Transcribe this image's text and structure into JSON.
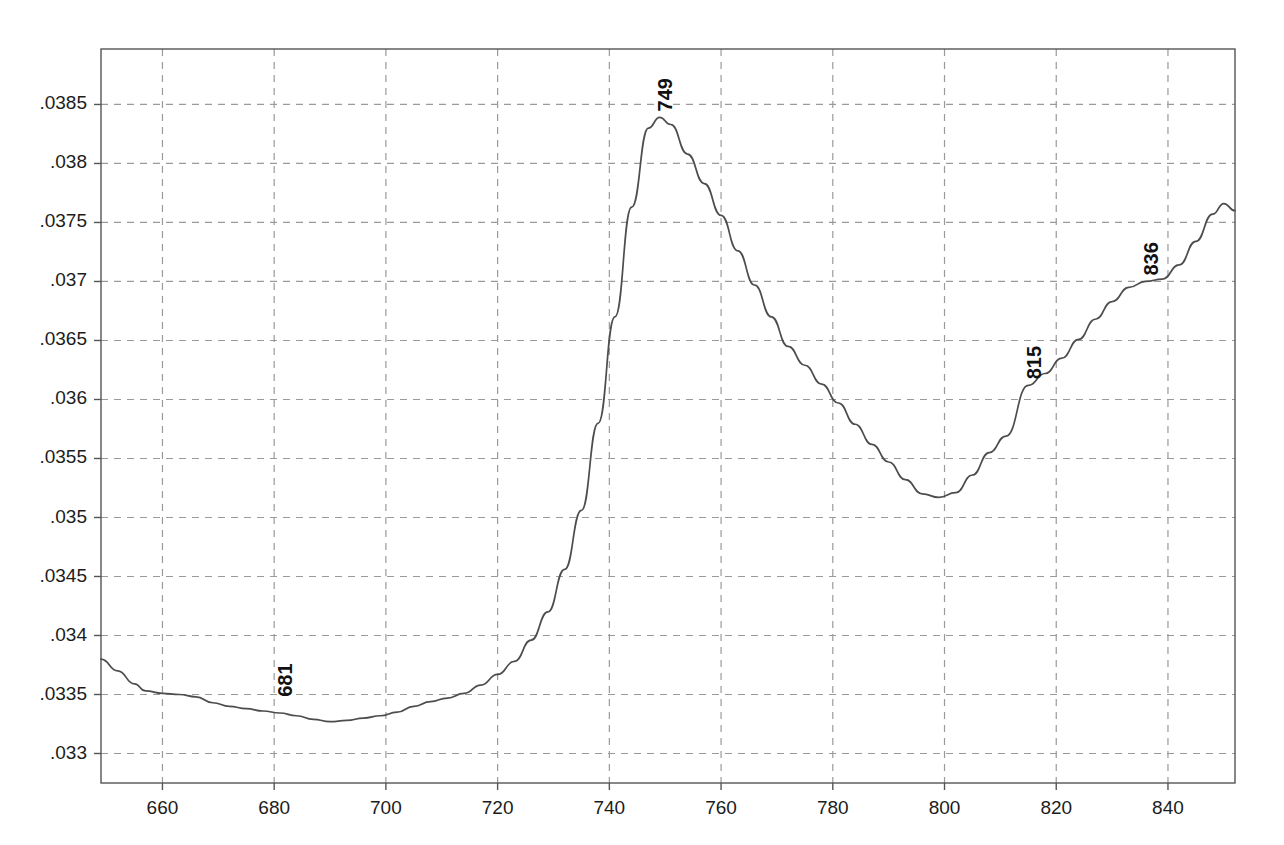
{
  "chart_data": {
    "type": "line",
    "title": "",
    "subtitle": "",
    "xlabel": "",
    "ylabel": "",
    "xlim": [
      649,
      852
    ],
    "ylim": [
      0.03275,
      0.03897
    ],
    "grid": true,
    "legend": null,
    "line_color": "#4d4d4d",
    "grid_color": "#9a9a9a",
    "axis_color": "#555555",
    "background": "#ffffff",
    "xticks": [
      660,
      680,
      700,
      720,
      740,
      760,
      780,
      800,
      820,
      840
    ],
    "xtick_labels": [
      "660",
      "680",
      "700",
      "720",
      "740",
      "760",
      "780",
      "800",
      "820",
      "840"
    ],
    "yticks": [
      0.033,
      0.0335,
      0.034,
      0.0345,
      0.035,
      0.0355,
      0.036,
      0.0365,
      0.037,
      0.0375,
      0.038,
      0.0385
    ],
    "ytick_labels": [
      ".033",
      ".0335",
      ".034",
      ".0345",
      ".035",
      ".0355",
      ".036",
      ".0365",
      ".037",
      ".0375",
      ".038",
      ".0385"
    ],
    "annotations": [
      {
        "label": "681",
        "x": 681,
        "y": 0.03343,
        "rotation": -90
      },
      {
        "label": "749",
        "x": 749,
        "y": 0.03839,
        "rotation": -90
      },
      {
        "label": "815",
        "x": 815,
        "y": 0.03612,
        "rotation": -90
      },
      {
        "label": "836",
        "x": 836,
        "y": 0.037,
        "rotation": -90
      }
    ],
    "series": [
      {
        "name": "spectrum",
        "x": [
          649,
          652,
          655,
          657,
          660,
          663,
          666,
          669,
          672,
          675,
          678,
          681,
          684,
          687,
          690,
          693,
          696,
          699,
          702,
          705,
          708,
          711,
          714,
          717,
          720,
          723,
          726,
          729,
          732,
          735,
          738,
          741,
          744,
          747,
          749,
          751,
          754,
          757,
          760,
          763,
          766,
          769,
          772,
          775,
          778,
          781,
          784,
          787,
          790,
          793,
          796,
          799,
          802,
          805,
          808,
          811,
          815,
          818,
          821,
          824,
          827,
          830,
          833,
          836,
          839,
          842,
          845,
          848,
          850,
          852
        ],
        "y": [
          0.0338,
          0.0337,
          0.03359,
          0.03353,
          0.03351,
          0.0335,
          0.03348,
          0.03343,
          0.0334,
          0.03338,
          0.03336,
          0.033343,
          0.03332,
          0.03329,
          0.03327,
          0.03328,
          0.0333,
          0.03332,
          0.03335,
          0.0334,
          0.03344,
          0.03347,
          0.03351,
          0.03358,
          0.03367,
          0.03378,
          0.03396,
          0.0342,
          0.03456,
          0.03506,
          0.0358,
          0.0367,
          0.03763,
          0.0383,
          0.03839,
          0.03833,
          0.03808,
          0.03783,
          0.03756,
          0.03726,
          0.03697,
          0.0367,
          0.03645,
          0.03629,
          0.03613,
          0.03597,
          0.03579,
          0.03562,
          0.03547,
          0.03532,
          0.0352,
          0.03517,
          0.03521,
          0.03536,
          0.03555,
          0.03569,
          0.03612,
          0.03622,
          0.03635,
          0.03651,
          0.03668,
          0.03683,
          0.03695,
          0.037,
          0.03702,
          0.03714,
          0.03734,
          0.03757,
          0.03766,
          0.0376
        ]
      }
    ]
  }
}
